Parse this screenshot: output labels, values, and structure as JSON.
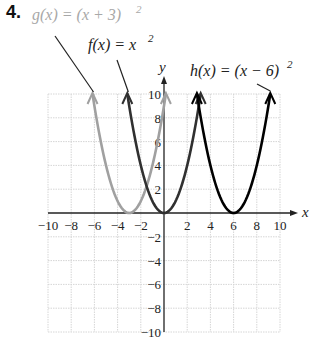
{
  "problem_number": "4.",
  "chart_data": {
    "type": "line",
    "title": "",
    "xlabel": "x",
    "ylabel": "y",
    "xlim": [
      -10,
      10
    ],
    "ylim": [
      -10,
      10
    ],
    "grid": true,
    "x_ticks": [
      "−10",
      "−8",
      "−6",
      "−4",
      "−2",
      "2",
      "4",
      "6",
      "8",
      "10"
    ],
    "y_ticks": [
      "10",
      "8",
      "6",
      "4",
      "2",
      "−2",
      "−4",
      "−6",
      "−8",
      "−10"
    ],
    "series": [
      {
        "name": "g(x) = (x + 3)^2",
        "label_text": "g(x) = (x + 3)",
        "exponent": "2",
        "color": "#a0a0a0",
        "vertex": [
          -3,
          0
        ],
        "x": [
          -6.16,
          -5,
          -4,
          -3,
          -2,
          -1,
          0.16
        ],
        "y": [
          10,
          4,
          1,
          0,
          1,
          4,
          10
        ]
      },
      {
        "name": "f(x) = x^2",
        "label_text": "f(x) = x",
        "exponent": "2",
        "color": "#303030",
        "vertex": [
          0,
          0
        ],
        "x": [
          -3.16,
          -2,
          -1,
          0,
          1,
          2,
          3.16
        ],
        "y": [
          10,
          4,
          1,
          0,
          1,
          4,
          10
        ]
      },
      {
        "name": "h(x) = (x − 6)^2",
        "label_text": "h(x) = (x − 6)",
        "exponent": "2",
        "color": "#000000",
        "vertex": [
          6,
          0
        ],
        "x": [
          2.84,
          4,
          5,
          6,
          7,
          8,
          9.16
        ],
        "y": [
          10,
          4,
          1,
          0,
          1,
          4,
          10
        ]
      }
    ]
  }
}
